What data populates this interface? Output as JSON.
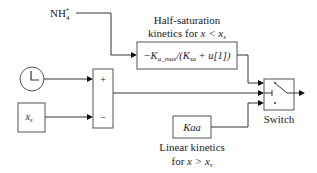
{
  "diagram": {
    "type": "simulink-block-diagram",
    "inputs": {
      "nh4": {
        "label": "NH",
        "sub": "4",
        "sup": "+"
      }
    },
    "blocks": {
      "half_saturation": {
        "caption_line1": "Half-saturation",
        "caption_line2_pre": "kinetics for ",
        "caption_line2_expr": "x < x",
        "caption_line2_sub": "s",
        "expr_minus_k": "−K",
        "expr_sub": "a_max",
        "expr_rest1": "/(K",
        "expr_sub2": "sa",
        "expr_rest2": " + u[1])"
      },
      "clock": {
        "icon": "clock-icon"
      },
      "xs_constant": {
        "label": "x",
        "sub": "s"
      },
      "sum": {
        "plus": "+",
        "minus": "−"
      },
      "kaa": {
        "label": "Kaa",
        "caption_line1": "Linear kinetics",
        "caption_line2_pre": "for ",
        "caption_line2_expr": "x > x",
        "caption_line2_sub": "s"
      },
      "switch": {
        "label": "Switch"
      }
    },
    "colors": {
      "stroke": "#555555",
      "wire": "#333333",
      "text": "#222222"
    }
  }
}
